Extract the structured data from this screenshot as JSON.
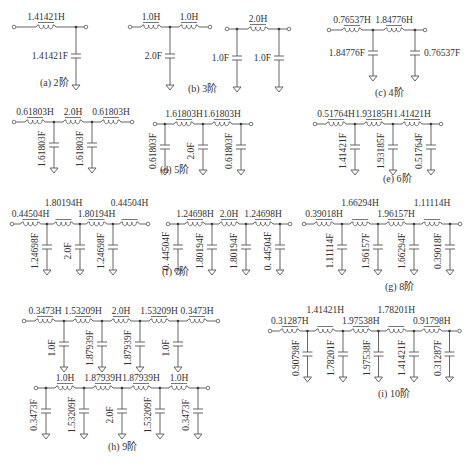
{
  "figure": {
    "circuits": [
      {
        "id": "a",
        "caption": "(a) 2阶",
        "variants": [
          {
            "elements": [
              {
                "type": "L",
                "value": "1.41421H"
              },
              {
                "type": "C",
                "value": "1.41421F"
              }
            ],
            "start_terminal": true,
            "end_terminal": true
          }
        ]
      },
      {
        "id": "b",
        "caption": "(b) 3阶",
        "variants": [
          {
            "elements": [
              {
                "type": "L",
                "value": "1.0H"
              },
              {
                "type": "C",
                "value": "2.0F"
              },
              {
                "type": "L",
                "value": "1.0H"
              }
            ],
            "start_terminal": true,
            "end_terminal": true
          },
          {
            "elements": [
              {
                "type": "C",
                "value": "1.0F"
              },
              {
                "type": "L",
                "value": "2.0H"
              },
              {
                "type": "C",
                "value": "1.0F"
              }
            ],
            "start_terminal": true,
            "end_terminal": true
          }
        ]
      },
      {
        "id": "c",
        "caption": "(c) 4阶",
        "variants": [
          {
            "elements": [
              {
                "type": "L",
                "value": "0.76537H"
              },
              {
                "type": "C",
                "value": "1.84776F"
              },
              {
                "type": "L",
                "value": "1.84776H"
              },
              {
                "type": "C",
                "value": "0.76537F"
              }
            ],
            "start_terminal": true,
            "end_terminal": true
          }
        ]
      },
      {
        "id": "d",
        "caption": "(d) 5阶",
        "variants": [
          {
            "elements": [
              {
                "type": "L",
                "value": "0.61803H"
              },
              {
                "type": "C",
                "value": "1.61803F"
              },
              {
                "type": "L",
                "value": "2.0H"
              },
              {
                "type": "C",
                "value": "1.61803F"
              },
              {
                "type": "L",
                "value": "0.61803H"
              }
            ],
            "start_terminal": true,
            "end_terminal": true
          },
          {
            "elements": [
              {
                "type": "C",
                "value": "0.61803F"
              },
              {
                "type": "L",
                "value": "1.61803H"
              },
              {
                "type": "C",
                "value": "2.0F"
              },
              {
                "type": "L",
                "value": "1.61803H"
              },
              {
                "type": "C",
                "value": "0.61803F"
              }
            ],
            "start_terminal": true,
            "end_terminal": true
          }
        ]
      },
      {
        "id": "e",
        "caption": "(e) 6阶",
        "variants": [
          {
            "elements": [
              {
                "type": "L",
                "value": "0.51764H"
              },
              {
                "type": "C",
                "value": "1.41421F"
              },
              {
                "type": "L",
                "value": "1.93185H"
              },
              {
                "type": "C",
                "value": "1.93185F"
              },
              {
                "type": "L",
                "value": "1.41421H"
              },
              {
                "type": "C",
                "value": "0.51764F"
              }
            ],
            "start_terminal": true,
            "end_terminal": true
          }
        ]
      },
      {
        "id": "f",
        "caption": "(f) 7阶",
        "variants": [
          {
            "elements": [
              {
                "type": "L",
                "value": "0.44504H"
              },
              {
                "type": "C",
                "value": "1.24698F"
              },
              {
                "type": "L",
                "value": "1.80194H"
              },
              {
                "type": "C",
                "value": "2.0F"
              },
              {
                "type": "L",
                "value": "1.80194H"
              },
              {
                "type": "C",
                "value": "1.24698F"
              },
              {
                "type": "L",
                "value": "0.44504H"
              }
            ],
            "start_terminal": true,
            "end_terminal": true
          },
          {
            "elements": [
              {
                "type": "C",
                "value": "0. 44504F"
              },
              {
                "type": "L",
                "value": "1.24698H"
              },
              {
                "type": "C",
                "value": "1.80194F"
              },
              {
                "type": "L",
                "value": "2.0H"
              },
              {
                "type": "C",
                "value": "1.80194F"
              },
              {
                "type": "L",
                "value": "1.24698H"
              },
              {
                "type": "C",
                "value": "0. 44504F"
              }
            ],
            "start_terminal": true,
            "end_terminal": true
          }
        ]
      },
      {
        "id": "g",
        "caption": "(g) 8阶",
        "variants": [
          {
            "elements": [
              {
                "type": "L",
                "value": "0.39018H"
              },
              {
                "type": "C",
                "value": "1.11114F"
              },
              {
                "type": "L",
                "value": "1.66294H"
              },
              {
                "type": "C",
                "value": "1.96157F"
              },
              {
                "type": "L",
                "value": "1.96157H"
              },
              {
                "type": "C",
                "value": "1.66294F"
              },
              {
                "type": "L",
                "value": "1.11114H"
              },
              {
                "type": "C",
                "value": "0.39018F"
              }
            ],
            "start_terminal": true,
            "end_terminal": true
          }
        ]
      },
      {
        "id": "h",
        "caption": "(h) 9阶",
        "variants": [
          {
            "elements": [
              {
                "type": "L",
                "value": "0.3473H"
              },
              {
                "type": "C",
                "value": "1.0F"
              },
              {
                "type": "L",
                "value": "1.53209H"
              },
              {
                "type": "C",
                "value": "1.87939F"
              },
              {
                "type": "L",
                "value": "2.0H"
              },
              {
                "type": "C",
                "value": "1.87939F"
              },
              {
                "type": "L",
                "value": "1.53209H"
              },
              {
                "type": "C",
                "value": "1.0F"
              },
              {
                "type": "L",
                "value": "0.3473H"
              }
            ],
            "start_terminal": true,
            "end_terminal": true
          },
          {
            "elements": [
              {
                "type": "C",
                "value": "0.3473F"
              },
              {
                "type": "L",
                "value": "1.0H"
              },
              {
                "type": "C",
                "value": "1.53209F"
              },
              {
                "type": "L",
                "value": "1.87939H"
              },
              {
                "type": "C",
                "value": "2.0F"
              },
              {
                "type": "L",
                "value": "1.87939H"
              },
              {
                "type": "C",
                "value": "1.53209F"
              },
              {
                "type": "L",
                "value": "1.0H"
              },
              {
                "type": "C",
                "value": "0.3473F"
              }
            ],
            "start_terminal": true,
            "end_terminal": true
          }
        ]
      },
      {
        "id": "i",
        "caption": "(i) 10阶",
        "variants": [
          {
            "elements": [
              {
                "type": "L",
                "value": "0.31287H"
              },
              {
                "type": "C",
                "value": "0.90798F"
              },
              {
                "type": "L",
                "value": "1.41421H"
              },
              {
                "type": "C",
                "value": "1.78201F"
              },
              {
                "type": "L",
                "value": "1.97538H"
              },
              {
                "type": "C",
                "value": "1.97538F"
              },
              {
                "type": "L",
                "value": "1.78201H"
              },
              {
                "type": "C",
                "value": "1.41421F"
              },
              {
                "type": "L",
                "value": "0.91798H"
              },
              {
                "type": "C",
                "value": "0.31287F"
              }
            ],
            "start_terminal": true,
            "end_terminal": true
          }
        ]
      }
    ]
  }
}
